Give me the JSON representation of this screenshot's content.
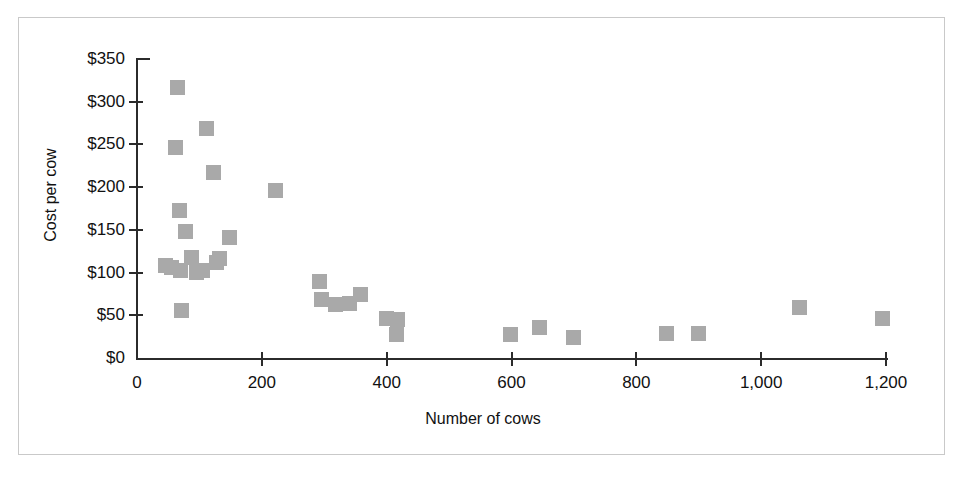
{
  "chart_data": {
    "type": "scatter",
    "title": "",
    "xlabel": "Number of cows",
    "ylabel": "Cost per cow",
    "xlim": [
      0,
      1200
    ],
    "ylim": [
      0,
      350
    ],
    "grid": false,
    "legend": null,
    "marker_color": "#a9a9a9",
    "marker_shape": "square",
    "axis_color": "#2b2b2b",
    "frame_color": "#c9c9c9",
    "x_ticks": [
      {
        "value": 0,
        "label": "0"
      },
      {
        "value": 200,
        "label": "200"
      },
      {
        "value": 400,
        "label": "400"
      },
      {
        "value": 600,
        "label": "600"
      },
      {
        "value": 800,
        "label": "800"
      },
      {
        "value": 1000,
        "label": "1,000"
      },
      {
        "value": 1200,
        "label": "1,200"
      }
    ],
    "y_ticks": [
      {
        "value": 0,
        "label": "$0"
      },
      {
        "value": 50,
        "label": "$50"
      },
      {
        "value": 100,
        "label": "$100"
      },
      {
        "value": 150,
        "label": "$150"
      },
      {
        "value": 200,
        "label": "$200"
      },
      {
        "value": 250,
        "label": "$250"
      },
      {
        "value": 300,
        "label": "$300"
      },
      {
        "value": 350,
        "label": "$350"
      }
    ],
    "points": [
      {
        "x": 45,
        "y": 108
      },
      {
        "x": 55,
        "y": 106
      },
      {
        "x": 62,
        "y": 246
      },
      {
        "x": 65,
        "y": 317
      },
      {
        "x": 68,
        "y": 173
      },
      {
        "x": 70,
        "y": 103
      },
      {
        "x": 72,
        "y": 56
      },
      {
        "x": 78,
        "y": 148
      },
      {
        "x": 88,
        "y": 118
      },
      {
        "x": 95,
        "y": 100
      },
      {
        "x": 105,
        "y": 103
      },
      {
        "x": 112,
        "y": 269
      },
      {
        "x": 122,
        "y": 217
      },
      {
        "x": 128,
        "y": 112
      },
      {
        "x": 132,
        "y": 116
      },
      {
        "x": 148,
        "y": 141
      },
      {
        "x": 222,
        "y": 196
      },
      {
        "x": 292,
        "y": 89
      },
      {
        "x": 295,
        "y": 69
      },
      {
        "x": 318,
        "y": 63
      },
      {
        "x": 340,
        "y": 64
      },
      {
        "x": 358,
        "y": 74
      },
      {
        "x": 400,
        "y": 46
      },
      {
        "x": 418,
        "y": 45
      },
      {
        "x": 415,
        "y": 28
      },
      {
        "x": 598,
        "y": 27
      },
      {
        "x": 645,
        "y": 36
      },
      {
        "x": 700,
        "y": 24
      },
      {
        "x": 848,
        "y": 29
      },
      {
        "x": 900,
        "y": 29
      },
      {
        "x": 1062,
        "y": 59
      },
      {
        "x": 1195,
        "y": 46
      }
    ]
  }
}
